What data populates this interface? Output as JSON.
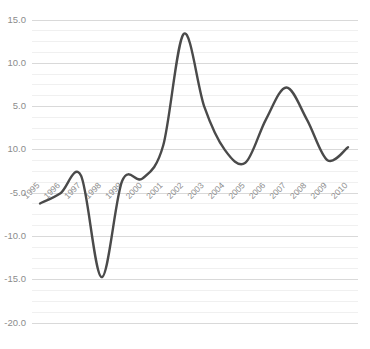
{
  "chart_data": {
    "type": "line",
    "title": "",
    "subtitle": "",
    "xlabel": "",
    "ylabel": "",
    "categories": [
      "1995",
      "1996",
      "1997",
      "1998",
      "1999",
      "2000",
      "2001",
      "2002",
      "2003",
      "2004",
      "2005",
      "2006",
      "2007",
      "2008",
      "2009",
      "2010"
    ],
    "series": [
      {
        "name": "",
        "color": "#4a4a4a",
        "values": [
          -6.2,
          -5.0,
          -3.0,
          -14.7,
          -3.6,
          -3.3,
          0.5,
          13.4,
          5.0,
          0.0,
          -1.5,
          3.5,
          7.2,
          3.5,
          -1.2,
          0.3
        ]
      }
    ],
    "ylim": [
      -20.0,
      15.0
    ],
    "ytick_labels": [
      "15.0",
      "10.0",
      "5.0",
      "10.0",
      "-5.0",
      "-10.0",
      "-15.0",
      "-20.0"
    ],
    "ytick_values": [
      15.0,
      10.0,
      5.0,
      0.0,
      -5.0,
      -10.0,
      -15.0,
      -20.0
    ],
    "minor_tick_step": 1.25,
    "grid": true,
    "grid_color_major": "#d9d9d9",
    "grid_color_minor": "#f0f0f0",
    "legend": "none",
    "xtick_rotation": 45,
    "background": "#ffffff",
    "axis_label_color": "#8c8c8c",
    "smoothing": "spline",
    "annotations": []
  }
}
